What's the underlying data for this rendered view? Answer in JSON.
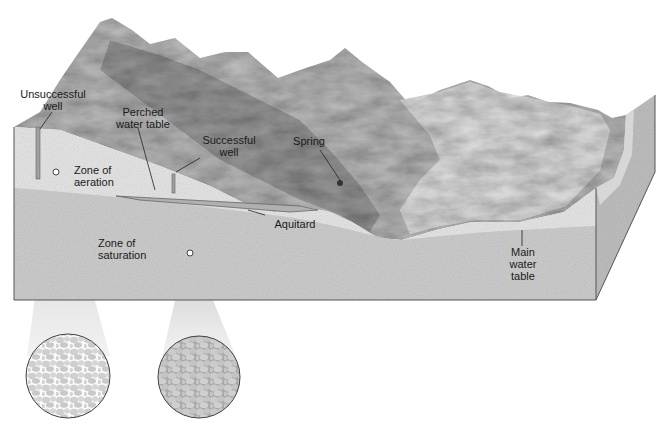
{
  "diagram": {
    "type": "groundwater block diagram",
    "labels": {
      "unsuccessful_well": "Unsuccessful\nwell",
      "perched_water_table": "Perched\nwater table",
      "successful_well": "Successful\nwell",
      "spring": "Spring",
      "zone_of_aeration": "Zone of\naeration",
      "aquitard": "Aquitard",
      "zone_of_saturation": "Zone of\nsaturation",
      "main_water_table": "Main\nwater\ntable"
    },
    "magnifiers": [
      {
        "name": "aeration-zone-sample",
        "description": "pore spaces partly filled with air"
      },
      {
        "name": "saturation-zone-sample",
        "description": "pore spaces filled with water"
      }
    ],
    "colors": {
      "mountain_dark": "#8c8c8c",
      "mountain_light": "#d6d6d6",
      "aeration_zone": "#e4e4e4",
      "saturation_zone": "#c9c9c9",
      "side_face": "#bdbdbd",
      "aquitard": "#b0b0b0",
      "outline": "#555555",
      "text": "#1a1a1a"
    }
  }
}
